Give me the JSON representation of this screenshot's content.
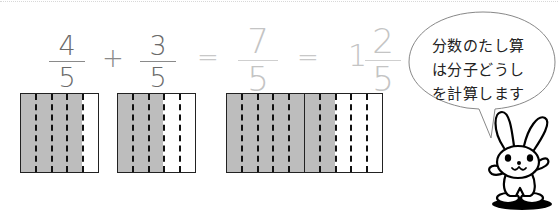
{
  "equation": {
    "term1": {
      "numerator": "4",
      "denominator": "5"
    },
    "plus": "+",
    "term2": {
      "numerator": "3",
      "denominator": "5"
    },
    "equals1": "=",
    "result": {
      "numerator": "7",
      "denominator": "5"
    },
    "equals2": "=",
    "mixed": {
      "whole": "1",
      "numerator": "2",
      "denominator": "5"
    }
  },
  "models": [
    {
      "label": "4/5",
      "squares": [
        {
          "shaded": 4,
          "parts": 5
        }
      ]
    },
    {
      "label": "3/5",
      "squares": [
        {
          "shaded": 3,
          "parts": 5
        }
      ]
    },
    {
      "label": "7/5",
      "squares": [
        {
          "shaded": 5,
          "parts": 5
        },
        {
          "shaded": 2,
          "parts": 5
        }
      ]
    }
  ],
  "speech_bubble": {
    "lines": [
      "分数のたし算",
      "は分子どうし",
      "を計算します"
    ]
  },
  "colors": {
    "shaded": "#bdbdbd",
    "outline": "#222222",
    "operand_text": "#6a6a6a",
    "result_text": "#c4c4c4"
  },
  "character": "rabbit"
}
